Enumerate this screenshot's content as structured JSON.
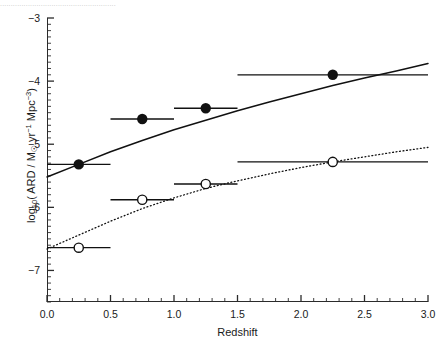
{
  "figure": {
    "top_caption": "......................................................",
    "background_color": "#ffffff",
    "ink_color": "#1a1a1a"
  },
  "axes": {
    "x": {
      "title": "Redshift",
      "min": 0.0,
      "max": 3.0,
      "major_ticks": [
        0.0,
        0.5,
        1.0,
        1.5,
        2.0,
        2.5,
        3.0
      ],
      "major_tick_labels": [
        "0.0",
        "0.5",
        "1.0",
        "1.5",
        "2.0",
        "2.5",
        "3.0"
      ],
      "minor_tick_step": 0.1
    },
    "y": {
      "title_parts": {
        "log": "log",
        "log_sub": "10",
        "open": "( ARD / M",
        "sun": "☉",
        "yr": " yr",
        "yr_sup": "−1",
        "mpc": " Mpc",
        "mpc_sup": "−3",
        "close": ")"
      },
      "title_plain": "log10( ARD / M☉ yr−1 Mpc−3 )",
      "min": -7.5,
      "max": -3.0,
      "major_ticks": [
        -3,
        -4,
        -5,
        -6,
        -7
      ],
      "major_tick_labels": [
        "−3",
        "−4",
        "−5",
        "−6",
        "−7"
      ],
      "minor_tick_step": 0.1
    }
  },
  "chart_data": {
    "type": "scatter",
    "title": "",
    "xlabel": "Redshift",
    "ylabel": "log10( ARD / M☉ yr−1 Mpc−3 )",
    "xlim": [
      0.0,
      3.0
    ],
    "ylim": [
      -7.5,
      -3.0
    ],
    "grid": false,
    "legend": "none",
    "series": [
      {
        "name": "filled-circles",
        "marker": "filled-circle",
        "marker_color": "#111111",
        "curve_style": "solid",
        "x": [
          0.25,
          0.75,
          1.25,
          2.25
        ],
        "y": [
          -5.32,
          -4.6,
          -4.43,
          -3.9
        ],
        "xerr_low": [
          0.25,
          0.25,
          0.25,
          0.75
        ],
        "xerr_high": [
          0.25,
          0.25,
          0.25,
          0.75
        ],
        "fit_curve": {
          "x": [
            0.0,
            0.25,
            0.5,
            0.75,
            1.0,
            1.25,
            1.5,
            1.75,
            2.0,
            2.25,
            2.5,
            2.75,
            3.0
          ],
          "y": [
            -5.52,
            -5.32,
            -5.12,
            -4.94,
            -4.77,
            -4.62,
            -4.47,
            -4.33,
            -4.2,
            -4.07,
            -3.95,
            -3.84,
            -3.72
          ]
        }
      },
      {
        "name": "open-circles",
        "marker": "open-circle",
        "marker_color": "#111111",
        "curve_style": "dotted",
        "x": [
          0.25,
          0.75,
          1.25,
          2.25
        ],
        "y": [
          -6.64,
          -5.88,
          -5.63,
          -5.28
        ],
        "xerr_low": [
          0.25,
          0.25,
          0.25,
          0.75
        ],
        "xerr_high": [
          0.25,
          0.25,
          0.25,
          0.75
        ],
        "fit_curve": {
          "x": [
            0.0,
            0.25,
            0.5,
            0.75,
            1.0,
            1.25,
            1.5,
            1.75,
            2.0,
            2.25,
            2.5,
            2.75,
            3.0
          ],
          "y": [
            -6.66,
            -6.44,
            -6.22,
            -6.02,
            -5.85,
            -5.7,
            -5.58,
            -5.47,
            -5.37,
            -5.28,
            -5.2,
            -5.12,
            -5.05
          ]
        }
      }
    ]
  }
}
